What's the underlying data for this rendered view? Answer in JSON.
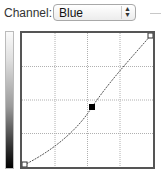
{
  "channel": {
    "label": "Channel:",
    "selected": "Blue",
    "stepper_icon": "up-down-arrows-icon",
    "stepper_glyph_up": "▲",
    "stepper_glyph_down": "▼"
  },
  "curve": {
    "grid_divisions": 4,
    "control_point": {
      "x_pct": 53,
      "y_pct": 55
    },
    "endpoints": [
      {
        "x_pct": 0,
        "y_pct": 0
      },
      {
        "x_pct": 100,
        "y_pct": 100
      }
    ],
    "line_color": "#555555",
    "grid_color": "#b0b0b0"
  }
}
